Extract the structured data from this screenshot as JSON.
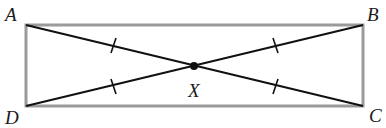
{
  "diagram": {
    "type": "geometry",
    "points": {
      "A": {
        "label": "A",
        "x": 26,
        "y": 25
      },
      "B": {
        "label": "B",
        "x": 363,
        "y": 25
      },
      "C": {
        "label": "C",
        "x": 363,
        "y": 106
      },
      "D": {
        "label": "D",
        "x": 26,
        "y": 106
      },
      "X": {
        "label": "X",
        "x": 194,
        "y": 66
      }
    },
    "segments": [
      {
        "name": "AB",
        "kind": "side"
      },
      {
        "name": "BC",
        "kind": "side"
      },
      {
        "name": "CD",
        "kind": "side"
      },
      {
        "name": "DA",
        "kind": "side"
      },
      {
        "name": "AC",
        "kind": "diagonal"
      },
      {
        "name": "BD",
        "kind": "diagonal"
      }
    ],
    "congruence_marks": [
      "AX",
      "BX",
      "CX",
      "DX"
    ],
    "colors": {
      "rectangle_stroke": "#9a9a9a",
      "diagonal_stroke": "#111111",
      "label_fill": "#1a1a1a"
    }
  }
}
